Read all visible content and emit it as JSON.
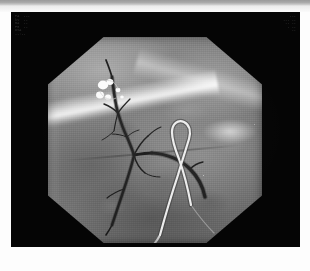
{
  "viewer": {
    "modality_label": "fluoroscopy-angiogram",
    "background_color": "#050505",
    "frame_color": "#fdfdfd",
    "top_strip_color": "#9a9a9a"
  },
  "image": {
    "collimation_shape": "octagon",
    "field_color": "#7d7d7d",
    "description": "Digital subtraction angiogram of the abdominal / hepatic arterial tree with catheter in situ",
    "features": {
      "vessel_tree_label": "contrast-filled arterial tree",
      "catheter_label": "angiographic catheter",
      "coils_label": "radiopaque embolization coils",
      "diaphragm_label": "diaphragm / lung base band"
    }
  },
  "overlays": {
    "top_left": [
      "PA  ---",
      "kV  --",
      "mA  --",
      "FR  --",
      "DSA",
      "--:--"
    ],
    "top_right": [
      "---",
      "--- --",
      "-- --",
      "- --",
      "--"
    ],
    "bottom_left": [],
    "bottom_right": []
  },
  "chart_data": null
}
